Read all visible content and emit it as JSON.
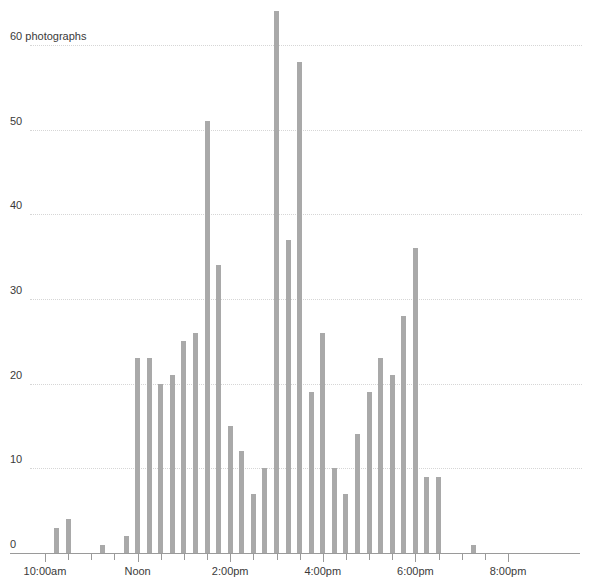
{
  "chart_data": {
    "type": "bar",
    "title": "",
    "subtitle": "",
    "xlabel": "",
    "ylabel": "photographs",
    "y_axis_top_label": "60 photographs",
    "ytick_labels": [
      "0",
      "10",
      "20",
      "30",
      "40",
      "50",
      "60 photographs"
    ],
    "ytick_values": [
      0,
      10,
      20,
      30,
      40,
      50,
      60
    ],
    "ylim": [
      0,
      64
    ],
    "grid": true,
    "grid_axis": "y",
    "legend": "none",
    "bar_color": "#a9a9a9",
    "grid_color": "#d6d6d6",
    "axis_color": "#9a9a9a",
    "text_color": "#3a3a3a",
    "x_axis_type": "time",
    "x_bin_minutes": 15,
    "xlim": [
      "09:45",
      "20:15"
    ],
    "xtick_labels": [
      "10:00am",
      "Noon",
      "2:00pm",
      "4:00pm",
      "6:00pm",
      "8:00pm"
    ],
    "xtick_times": [
      "10:00",
      "12:00",
      "14:00",
      "16:00",
      "18:00",
      "20:00"
    ],
    "x": [
      "10:15",
      "10:30",
      "11:15",
      "11:45",
      "12:00",
      "12:15",
      "12:30",
      "12:45",
      "13:00",
      "13:15",
      "13:30",
      "13:45",
      "14:00",
      "14:15",
      "14:30",
      "14:45",
      "15:00",
      "15:15",
      "15:30",
      "15:45",
      "16:00",
      "16:15",
      "16:30",
      "16:45",
      "17:00",
      "17:15",
      "17:30",
      "17:45",
      "18:00",
      "18:15",
      "18:30",
      "18:45",
      "19:15"
    ],
    "values": [
      3,
      4,
      1,
      2,
      23,
      23,
      20,
      21,
      25,
      26,
      51,
      34,
      15,
      12,
      7,
      10,
      64,
      37,
      58,
      19,
      26,
      10,
      7,
      14,
      19,
      23,
      21,
      28,
      36,
      9,
      9,
      0,
      1
    ],
    "categories": [
      "10:15am",
      "10:30am",
      "11:15am",
      "11:45am",
      "12:00pm",
      "12:15pm",
      "12:30pm",
      "12:45pm",
      "1:00pm",
      "1:15pm",
      "1:30pm",
      "1:45pm",
      "2:00pm",
      "2:15pm",
      "2:30pm",
      "2:45pm",
      "3:00pm",
      "3:15pm",
      "3:30pm",
      "3:45pm",
      "4:00pm",
      "4:15pm",
      "4:30pm",
      "4:45pm",
      "5:00pm",
      "5:15pm",
      "5:30pm",
      "5:45pm",
      "6:00pm",
      "6:15pm",
      "6:30pm",
      "6:45pm",
      "7:15pm"
    ]
  }
}
